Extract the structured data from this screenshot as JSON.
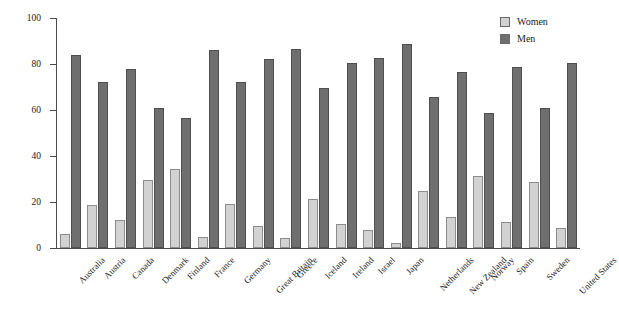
{
  "chart_data": {
    "type": "bar",
    "title": "",
    "xlabel": "",
    "ylabel": "Percent of legislative representation",
    "ylim": [
      0,
      100
    ],
    "yticks": [
      0,
      20,
      40,
      60,
      80,
      100
    ],
    "grid": false,
    "legend_position": "top-right",
    "categories": [
      "Australia",
      "Austria",
      "Canada",
      "Denmark",
      "Finland",
      "France",
      "Germany",
      "Great Britain",
      "Greece",
      "Iceland",
      "Ireland",
      "Israel",
      "Japan",
      "Netherlands",
      "New Zealand",
      "Norway",
      "Spain",
      "Sweden",
      "United States"
    ],
    "series": [
      {
        "name": "Women",
        "color": "#d2d2d2",
        "values": [
          6,
          18.5,
          12,
          29.5,
          34.5,
          5,
          19,
          9.5,
          4.5,
          21.5,
          10.5,
          8,
          2,
          25,
          13.5,
          31.5,
          11.5,
          28.5,
          8.5
        ]
      },
      {
        "name": "Men",
        "color": "#6f6f6f",
        "values": [
          84,
          72,
          78,
          61,
          56.5,
          86,
          72,
          82,
          86.5,
          69.5,
          80.5,
          82.5,
          88.5,
          65.5,
          76.5,
          58.5,
          78.5,
          61,
          80.5
        ]
      }
    ]
  },
  "legend": {
    "items": [
      {
        "label": "Women",
        "swatch": "women"
      },
      {
        "label": "Men",
        "swatch": "men"
      }
    ]
  }
}
